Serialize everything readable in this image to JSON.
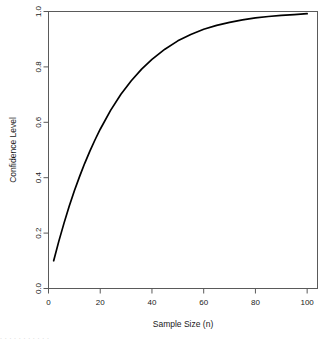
{
  "chart_data": {
    "type": "line",
    "title": "",
    "xlabel": "Sample Size (n)",
    "ylabel": "Confidence Level",
    "xlim": [
      0,
      104
    ],
    "ylim": [
      0.0,
      1.0
    ],
    "grid": false,
    "legend": false,
    "xticks": [
      0,
      20,
      40,
      60,
      80,
      100
    ],
    "xticklabels": [
      "0",
      "20",
      "40",
      "60",
      "80",
      "100"
    ],
    "yticks": [
      0.0,
      0.2,
      0.4,
      0.6,
      0.8,
      1.0
    ],
    "yticklabels": [
      "0.0",
      "0.2",
      "0.4",
      "0.6",
      "0.8",
      "1.0"
    ],
    "series": [
      {
        "name": "Confidence Level",
        "color": "#000000",
        "x": [
          2,
          4,
          6,
          8,
          10,
          12,
          14,
          16,
          18,
          20,
          24,
          28,
          32,
          36,
          40,
          45,
          50,
          55,
          60,
          65,
          70,
          75,
          80,
          85,
          90,
          95,
          100
        ],
        "y": [
          0.1,
          0.171,
          0.236,
          0.297,
          0.353,
          0.404,
          0.452,
          0.496,
          0.537,
          0.575,
          0.643,
          0.701,
          0.75,
          0.792,
          0.827,
          0.864,
          0.894,
          0.917,
          0.936,
          0.95,
          0.961,
          0.97,
          0.977,
          0.982,
          0.986,
          0.989,
          0.992
        ]
      }
    ]
  },
  "axes": {
    "x_title": "Sample Size (n)",
    "y_title": "Confidence Level"
  },
  "footer": {
    "artifact_text": ". .       .   .     . .    .  .            .   .   ."
  }
}
